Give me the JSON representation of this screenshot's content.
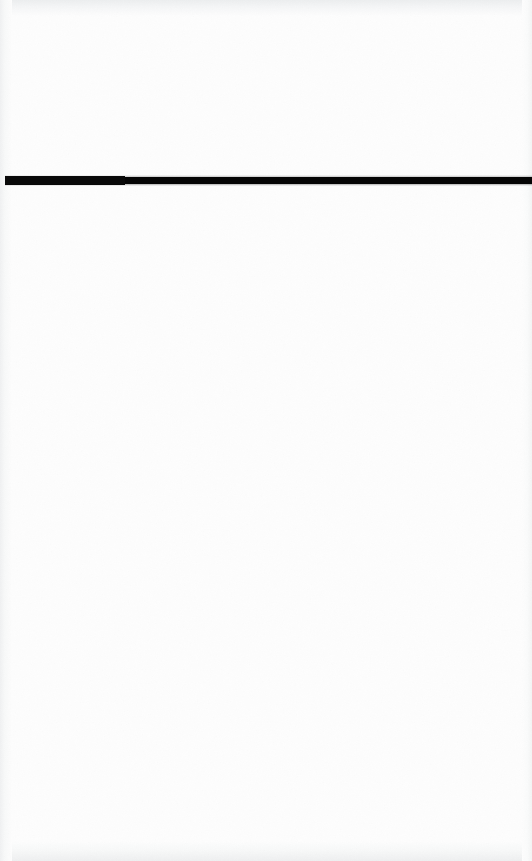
{
  "document": {
    "kind": "scanned-page",
    "page_label": "",
    "title": "",
    "background_color": "#fdfdfd",
    "ink_color": "#050505",
    "width_px": 532,
    "height_px": 861
  },
  "content": {
    "header_text": "",
    "body_text": "",
    "footer_text": "",
    "page_number": "",
    "above_rule_text": "",
    "below_rule_text": ""
  },
  "rule": {
    "name": "horizontal-rule",
    "color": "#050505",
    "left_px": 5,
    "top_px": 177,
    "width_px": 527,
    "thickness_px": 7,
    "label": ""
  },
  "scan_artifacts": {
    "top_edge_shade": "#eceeef",
    "bottom_edge_shade": "#eeeff0",
    "left_edge_shade": "#f0f1f2",
    "right_edge_shade": "#f3f4f4",
    "grain_opacity": "0.55"
  }
}
